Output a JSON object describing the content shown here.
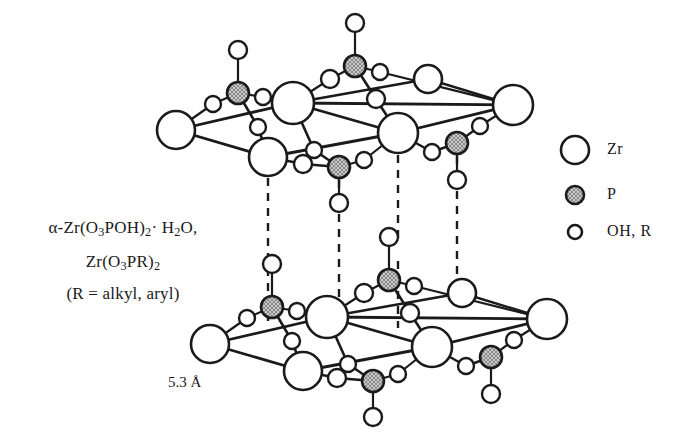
{
  "figure": {
    "distance_label": "5.3 Å"
  },
  "formula": {
    "line1_html": "α-Zr(O<sub>3</sub>POH)<sub>2</sub>· H<sub>2</sub>O,",
    "line2_html": "Zr(O<sub>3</sub>PR)<sub>2</sub>",
    "line3_html": "(R = alkyl, aryl)",
    "line1_text": "α-Zr(O3POH)2· H2O,",
    "line2_text": "Zr(O3PR)2",
    "line3_text": "(R = alkyl, aryl)"
  },
  "legend": {
    "items": [
      {
        "label": "Zr",
        "icon": "open-circle-large",
        "radius": 14,
        "fill": "#ffffff",
        "stroke": "#1a1a1a"
      },
      {
        "label": "P",
        "icon": "hatched-circle-mid",
        "radius": 9,
        "fill": "#b8b8b8",
        "stroke": "#1a1a1a"
      },
      {
        "label": "OH, R",
        "icon": "open-circle-small",
        "radius": 7,
        "fill": "#ffffff",
        "stroke": "#1a1a1a"
      }
    ]
  },
  "colors": {
    "stroke": "#1a1a1a",
    "zr_fill": "#ffffff",
    "p_fill": "#b5b5b5",
    "o_fill": "#ffffff",
    "background": "#ffffff"
  },
  "structure": {
    "note": "Two parallel zirconium phosphate layers separated by 5.3 Angstrom, joined by vertical dashed interlayer lines.",
    "upper_layer": {
      "zr": [
        {
          "id": "u-zr-1",
          "x": 176,
          "y": 130,
          "r": 19
        },
        {
          "id": "u-zr-2",
          "x": 293,
          "y": 103,
          "r": 21
        },
        {
          "id": "u-zr-3",
          "x": 268,
          "y": 157,
          "r": 19
        },
        {
          "id": "u-zr-4",
          "x": 398,
          "y": 133,
          "r": 20
        },
        {
          "id": "u-zr-5",
          "x": 513,
          "y": 105,
          "r": 20
        },
        {
          "id": "u-zr-6",
          "x": 428,
          "y": 79,
          "r": 14
        }
      ],
      "p": [
        {
          "id": "u-p-1",
          "x": 238,
          "y": 93,
          "r": 11
        },
        {
          "id": "u-p-2",
          "x": 355,
          "y": 66,
          "r": 11
        },
        {
          "id": "u-p-3",
          "x": 339,
          "y": 167,
          "r": 11
        },
        {
          "id": "u-p-4",
          "x": 457,
          "y": 143,
          "r": 11
        }
      ],
      "o": [
        {
          "id": "u-o-1",
          "x": 213,
          "y": 104,
          "r": 8
        },
        {
          "id": "u-o-2",
          "x": 263,
          "y": 97,
          "r": 8
        },
        {
          "id": "u-o-3",
          "x": 258,
          "y": 127,
          "r": 8
        },
        {
          "id": "u-o-4",
          "x": 330,
          "y": 79,
          "r": 9
        },
        {
          "id": "u-o-5",
          "x": 380,
          "y": 72,
          "r": 8
        },
        {
          "id": "u-o-6",
          "x": 376,
          "y": 99,
          "r": 9
        },
        {
          "id": "u-o-7",
          "x": 314,
          "y": 150,
          "r": 8
        },
        {
          "id": "u-o-8",
          "x": 303,
          "y": 164,
          "r": 9
        },
        {
          "id": "u-o-9",
          "x": 364,
          "y": 160,
          "r": 8
        },
        {
          "id": "u-o-10",
          "x": 432,
          "y": 152,
          "r": 8
        },
        {
          "id": "u-o-11",
          "x": 480,
          "y": 126,
          "r": 8
        }
      ],
      "oh_up": [
        {
          "id": "u-oh-1",
          "x": 238,
          "y": 50,
          "r": 9,
          "bond_to": "u-p-1"
        },
        {
          "id": "u-oh-2",
          "x": 355,
          "y": 23,
          "r": 9,
          "bond_to": "u-p-2"
        }
      ],
      "oh_down": [
        {
          "id": "u-ohd-1",
          "x": 339,
          "y": 203,
          "r": 9,
          "bond_to": "u-p-3"
        },
        {
          "id": "u-ohd-2",
          "x": 457,
          "y": 180,
          "r": 9,
          "bond_to": "u-p-4"
        }
      ]
    },
    "lower_layer": {
      "zr": [
        {
          "id": "l-zr-1",
          "x": 210,
          "y": 344,
          "r": 19
        },
        {
          "id": "l-zr-2",
          "x": 327,
          "y": 317,
          "r": 21
        },
        {
          "id": "l-zr-3",
          "x": 303,
          "y": 371,
          "r": 19
        },
        {
          "id": "l-zr-4",
          "x": 432,
          "y": 347,
          "r": 20
        },
        {
          "id": "l-zr-5",
          "x": 547,
          "y": 319,
          "r": 20
        },
        {
          "id": "l-zr-6",
          "x": 462,
          "y": 293,
          "r": 14
        }
      ],
      "p": [
        {
          "id": "l-p-1",
          "x": 272,
          "y": 307,
          "r": 11
        },
        {
          "id": "l-p-2",
          "x": 389,
          "y": 280,
          "r": 11
        },
        {
          "id": "l-p-3",
          "x": 373,
          "y": 381,
          "r": 11
        },
        {
          "id": "l-p-4",
          "x": 491,
          "y": 357,
          "r": 11
        }
      ],
      "o": [
        {
          "id": "l-o-1",
          "x": 247,
          "y": 318,
          "r": 8
        },
        {
          "id": "l-o-2",
          "x": 297,
          "y": 311,
          "r": 8
        },
        {
          "id": "l-o-3",
          "x": 292,
          "y": 341,
          "r": 8
        },
        {
          "id": "l-o-4",
          "x": 364,
          "y": 293,
          "r": 9
        },
        {
          "id": "l-o-5",
          "x": 414,
          "y": 286,
          "r": 8
        },
        {
          "id": "l-o-6",
          "x": 410,
          "y": 313,
          "r": 9
        },
        {
          "id": "l-o-7",
          "x": 348,
          "y": 364,
          "r": 8
        },
        {
          "id": "l-o-8",
          "x": 337,
          "y": 378,
          "r": 9
        },
        {
          "id": "l-o-9",
          "x": 398,
          "y": 374,
          "r": 8
        },
        {
          "id": "l-o-10",
          "x": 466,
          "y": 366,
          "r": 8
        },
        {
          "id": "l-o-11",
          "x": 514,
          "y": 340,
          "r": 8
        }
      ],
      "oh_up": [
        {
          "id": "l-oh-1",
          "x": 272,
          "y": 264,
          "r": 9,
          "bond_to": "l-p-1"
        },
        {
          "id": "l-oh-2",
          "x": 389,
          "y": 237,
          "r": 9,
          "bond_to": "l-p-2"
        }
      ],
      "oh_down": [
        {
          "id": "l-ohd-1",
          "x": 373,
          "y": 417,
          "r": 9,
          "bond_to": "l-p-3"
        },
        {
          "id": "l-ohd-2",
          "x": 491,
          "y": 394,
          "r": 9,
          "bond_to": "l-p-4"
        }
      ]
    },
    "interlayer_dashed": [
      {
        "id": "dash-1",
        "x": 268,
        "y1": 178,
        "y2": 325,
        "midpoint_o": null
      },
      {
        "id": "dash-2",
        "x": 339,
        "y1": 180,
        "y2": 306,
        "midpoint_o": {
          "x": 339,
          "y": 203,
          "r": 9
        }
      },
      {
        "id": "dash-3",
        "x": 398,
        "y1": 155,
        "y2": 328,
        "midpoint_o": {
          "x": 398,
          "y": 250,
          "r": 9
        }
      },
      {
        "id": "dash-4",
        "x": 457,
        "y1": 156,
        "y2": 280,
        "midpoint_o": {
          "x": 457,
          "y": 180,
          "r": 9
        }
      }
    ]
  }
}
